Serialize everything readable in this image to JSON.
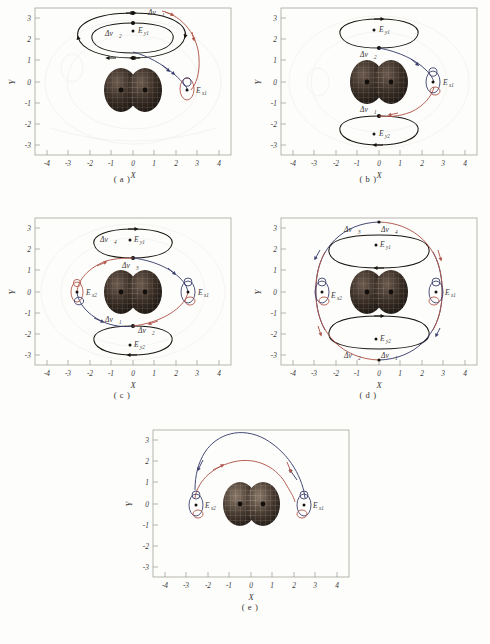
{
  "figure": {
    "kind": "orbital-transfer-trajectory-panels",
    "panel_count": 5,
    "axis": {
      "xlabel": "X",
      "ylabel": "Y",
      "xticks": [
        "-4",
        "-3",
        "-2",
        "-1",
        "0",
        "1",
        "2",
        "3",
        "4"
      ],
      "yticks": [
        "3",
        "2",
        "1",
        "0",
        "-1",
        "-2",
        "-3"
      ],
      "xlim": [
        -4.6,
        4.6
      ],
      "ylim": [
        -3.45,
        3.45
      ]
    },
    "colors": {
      "red_trajectory": "#b1574c",
      "blue_trajectory": "#3b3f6e",
      "black_orbit": "#17140f",
      "body": "#2a211c",
      "axis": "#8c8882",
      "background": "#fdfdfb"
    },
    "legend_note": {
      "red": "red transfer trajectory",
      "blue": "blue transfer trajectory",
      "black": "black periodic orbit"
    }
  },
  "panels": [
    {
      "id": "a",
      "caption": "( a )",
      "equilibria": [
        {
          "name": "E",
          "sub": "x1",
          "x": 2.52,
          "y": 0.0
        },
        {
          "name": "E",
          "sub": "y1",
          "x": 0.25,
          "y": 2.4
        }
      ],
      "impulses": [
        {
          "name": "Δv",
          "sub": "1",
          "x": 0.72,
          "y": 3.12
        },
        {
          "name": "Δv",
          "sub": "2",
          "x": -0.52,
          "y": 2.32
        }
      ]
    },
    {
      "id": "b",
      "caption": "( b )",
      "equilibria": [
        {
          "name": "E",
          "sub": "x1",
          "x": 2.95,
          "y": 0.0
        },
        {
          "name": "E",
          "sub": "y1",
          "x": 0.28,
          "y": 2.45
        },
        {
          "name": "E",
          "sub": "y2",
          "x": 0.28,
          "y": -2.4
        }
      ],
      "impulses": [
        {
          "name": "Δv",
          "sub": "2",
          "x": -0.22,
          "y": 1.55
        },
        {
          "name": "Δv",
          "sub": "1",
          "x": -0.22,
          "y": -1.58
        }
      ]
    },
    {
      "id": "c",
      "caption": "( c )",
      "equilibria": [
        {
          "name": "E",
          "sub": "x1",
          "x": 2.95,
          "y": 0.0
        },
        {
          "name": "E",
          "sub": "x2",
          "x": -2.1,
          "y": 0.0
        },
        {
          "name": "E",
          "sub": "y1",
          "x": 0.28,
          "y": 2.35
        },
        {
          "name": "E",
          "sub": "y2",
          "x": 0.28,
          "y": -2.5
        }
      ],
      "impulses": [
        {
          "name": "Δv",
          "sub": "4",
          "x": -0.72,
          "y": 2.35
        },
        {
          "name": "Δv",
          "sub": "3",
          "x": 0.22,
          "y": 1.45
        },
        {
          "name": "Δv",
          "sub": "1",
          "x": -0.42,
          "y": -1.48
        },
        {
          "name": "Δv",
          "sub": "2",
          "x": 0.62,
          "y": -2.02
        }
      ]
    },
    {
      "id": "d",
      "caption": "( d )",
      "equilibria": [
        {
          "name": "E",
          "sub": "x1",
          "x": 3.05,
          "y": 0.0
        },
        {
          "name": "E",
          "sub": "x2",
          "x": -2.0,
          "y": 0.0
        },
        {
          "name": "E",
          "sub": "y1",
          "x": 0.3,
          "y": 2.3
        },
        {
          "name": "E",
          "sub": "y2",
          "x": 0.3,
          "y": -2.45
        }
      ],
      "impulses": [
        {
          "name": "Δv",
          "sub": "3",
          "x": -0.85,
          "y": 3.0
        },
        {
          "name": "Δv",
          "sub": "4",
          "x": 0.45,
          "y": 3.0
        },
        {
          "name": "Δv",
          "sub": "2",
          "x": -0.85,
          "y": -3.05
        },
        {
          "name": "Δv",
          "sub": "1",
          "x": 0.45,
          "y": -3.05
        }
      ]
    },
    {
      "id": "e",
      "caption": "( e )",
      "equilibria": [
        {
          "name": "E",
          "sub": "x1",
          "x": 2.95,
          "y": -0.08
        },
        {
          "name": "E",
          "sub": "x2",
          "x": -2.1,
          "y": -0.08
        }
      ],
      "impulses": []
    }
  ]
}
